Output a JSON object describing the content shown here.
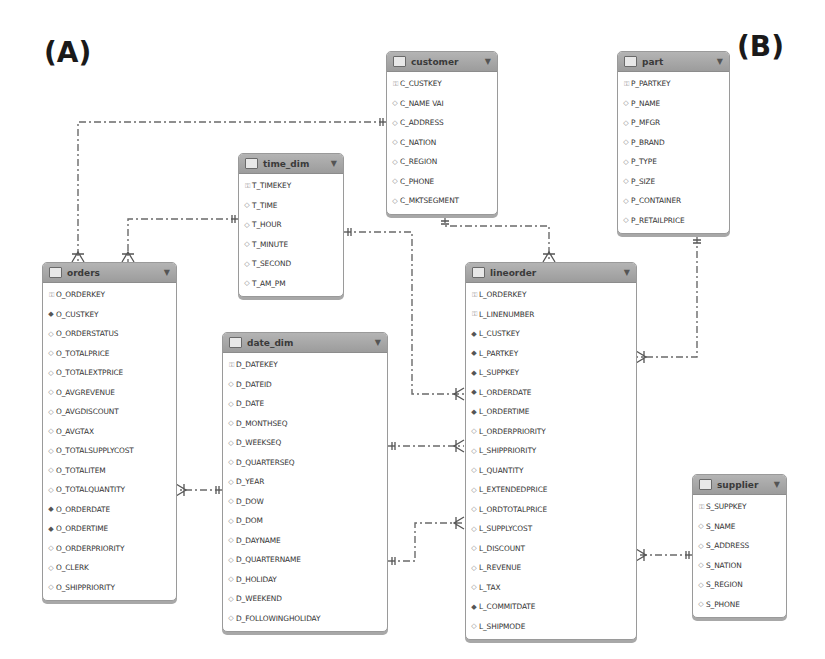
{
  "panel_labels": {
    "a": "(A)",
    "b": "(B)"
  },
  "icons": {
    "pk": "key-icon",
    "fk": "foreign-key-diamond-icon",
    "col": "column-diamond-icon",
    "table": "table-icon",
    "menu": "chevron-down-icon"
  },
  "glyphs": {
    "pk": "⚿",
    "fk": "◆",
    "col": "◇",
    "caret": "▼"
  },
  "entities": {
    "customer": {
      "name": "customer",
      "columns": [
        {
          "n": "C_CUSTKEY",
          "k": "pk"
        },
        {
          "n": "C_NAME VAI",
          "k": "col"
        },
        {
          "n": "C_ADDRESS",
          "k": "col"
        },
        {
          "n": "C_NATION",
          "k": "col"
        },
        {
          "n": "C_REGION",
          "k": "col"
        },
        {
          "n": "C_PHONE",
          "k": "col"
        },
        {
          "n": "C_MKTSEGMENT",
          "k": "col"
        }
      ]
    },
    "part": {
      "name": "part",
      "columns": [
        {
          "n": "P_PARTKEY",
          "k": "pk"
        },
        {
          "n": "P_NAME",
          "k": "col"
        },
        {
          "n": "P_MFGR",
          "k": "col"
        },
        {
          "n": "P_BRAND",
          "k": "col"
        },
        {
          "n": "P_TYPE",
          "k": "col"
        },
        {
          "n": "P_SIZE",
          "k": "col"
        },
        {
          "n": "P_CONTAINER",
          "k": "col"
        },
        {
          "n": "P_RETAILPRICE",
          "k": "col"
        }
      ]
    },
    "time_dim": {
      "name": "time_dim",
      "columns": [
        {
          "n": "T_TIMEKEY",
          "k": "pk"
        },
        {
          "n": "T_TIME",
          "k": "col"
        },
        {
          "n": "T_HOUR",
          "k": "col"
        },
        {
          "n": "T_MINUTE",
          "k": "col"
        },
        {
          "n": "T_SECOND",
          "k": "col"
        },
        {
          "n": "T_AM_PM",
          "k": "col"
        }
      ]
    },
    "orders": {
      "name": "orders",
      "columns": [
        {
          "n": "O_ORDERKEY",
          "k": "pk"
        },
        {
          "n": "O_CUSTKEY",
          "k": "fk"
        },
        {
          "n": "O_ORDERSTATUS",
          "k": "col"
        },
        {
          "n": "O_TOTALPRICE",
          "k": "col"
        },
        {
          "n": "O_TOTALEXTPRICE",
          "k": "col"
        },
        {
          "n": "O_AVGREVENUE",
          "k": "col"
        },
        {
          "n": "O_AVGDISCOUNT",
          "k": "col"
        },
        {
          "n": "O_AVGTAX",
          "k": "col"
        },
        {
          "n": "O_TOTALSUPPLYCOST",
          "k": "col"
        },
        {
          "n": "O_TOTALITEM",
          "k": "col"
        },
        {
          "n": "O_TOTALQUANTITY",
          "k": "col"
        },
        {
          "n": "O_ORDERDATE",
          "k": "fk"
        },
        {
          "n": "O_ORDERTIME",
          "k": "fk"
        },
        {
          "n": "O_ORDERPRIORITY",
          "k": "col"
        },
        {
          "n": "O_CLERK",
          "k": "col"
        },
        {
          "n": "O_SHIPPRIORITY",
          "k": "col"
        }
      ]
    },
    "date_dim": {
      "name": "date_dim",
      "columns": [
        {
          "n": "D_DATEKEY",
          "k": "pk"
        },
        {
          "n": "D_DATEID",
          "k": "col"
        },
        {
          "n": "D_DATE",
          "k": "col"
        },
        {
          "n": "D_MONTHSEQ",
          "k": "col"
        },
        {
          "n": "D_WEEKSEQ",
          "k": "col"
        },
        {
          "n": "D_QUARTERSEQ",
          "k": "col"
        },
        {
          "n": "D_YEAR",
          "k": "col"
        },
        {
          "n": "D_DOW",
          "k": "col"
        },
        {
          "n": "D_DOM",
          "k": "col"
        },
        {
          "n": "D_DAYNAME",
          "k": "col"
        },
        {
          "n": "D_QUARTERNAME",
          "k": "col"
        },
        {
          "n": "D_HOLIDAY",
          "k": "col"
        },
        {
          "n": "D_WEEKEND",
          "k": "col"
        },
        {
          "n": "D_FOLLOWINGHOLIDAY",
          "k": "col"
        }
      ]
    },
    "lineorder": {
      "name": "lineorder",
      "columns": [
        {
          "n": "L_ORDERKEY",
          "k": "pk"
        },
        {
          "n": "L_LINENUMBER",
          "k": "pk"
        },
        {
          "n": "L_CUSTKEY",
          "k": "fk"
        },
        {
          "n": "L_PARTKEY",
          "k": "fk"
        },
        {
          "n": "L_SUPPKEY",
          "k": "fk"
        },
        {
          "n": "L_ORDERDATE",
          "k": "fk"
        },
        {
          "n": "L_ORDERTIME",
          "k": "fk"
        },
        {
          "n": "L_ORDERPRIORITY",
          "k": "col"
        },
        {
          "n": "L_SHIPPRIORITY",
          "k": "col"
        },
        {
          "n": "L_QUANTITY",
          "k": "col"
        },
        {
          "n": "L_EXTENDEDPRICE",
          "k": "col"
        },
        {
          "n": "L_ORDTOTALPRICE",
          "k": "col"
        },
        {
          "n": "L_SUPPLYCOST",
          "k": "col"
        },
        {
          "n": "L_DISCOUNT",
          "k": "col"
        },
        {
          "n": "L_REVENUE",
          "k": "col"
        },
        {
          "n": "L_TAX",
          "k": "col"
        },
        {
          "n": "L_COMMITDATE",
          "k": "fk"
        },
        {
          "n": "L_SHIPMODE",
          "k": "col"
        }
      ]
    },
    "supplier": {
      "name": "supplier",
      "columns": [
        {
          "n": "S_SUPPKEY",
          "k": "pk"
        },
        {
          "n": "S_NAME",
          "k": "col"
        },
        {
          "n": "S_ADDRESS",
          "k": "col"
        },
        {
          "n": "S_NATION",
          "k": "col"
        },
        {
          "n": "S_REGION",
          "k": "col"
        },
        {
          "n": "S_PHONE",
          "k": "col"
        }
      ]
    }
  },
  "relationships": [
    {
      "from": "customer",
      "to": "orders"
    },
    {
      "from": "time_dim",
      "to": "orders"
    },
    {
      "from": "customer",
      "to": "lineorder"
    },
    {
      "from": "time_dim",
      "to": "lineorder"
    },
    {
      "from": "part",
      "to": "lineorder"
    },
    {
      "from": "date_dim",
      "to": "orders"
    },
    {
      "from": "date_dim",
      "to": "lineorder"
    },
    {
      "from": "supplier",
      "to": "lineorder"
    }
  ]
}
